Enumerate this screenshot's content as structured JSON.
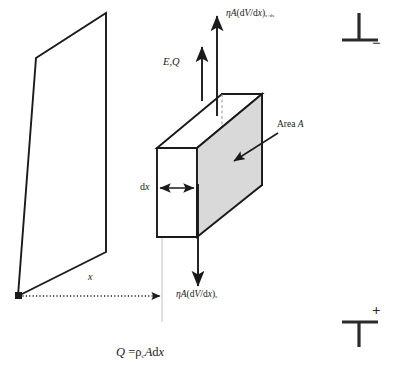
{
  "figure": {
    "type": "schematic-diagram",
    "background_color": "#ffffff",
    "line_color": "#1a1a1a",
    "shaded_face_color": "#d9d9d9"
  },
  "labels": {
    "flux_out": {
      "base": "ηA(dV/dx)",
      "subscript": "x+dx",
      "description": "flux leaving element at x plus dx"
    },
    "flux_in": {
      "base": "ηA(dV/dx)",
      "subscript": "x",
      "description": "flux entering element at x"
    },
    "field_charge": {
      "text": "E,Q",
      "description": "electric field and charge direction"
    },
    "area": {
      "text": "Area A",
      "description": "cross-sectional area of shaded face"
    },
    "thickness": {
      "text": "dx",
      "description": "element thickness along x"
    },
    "distance": {
      "text": "x",
      "description": "distance from electrode plane to element"
    },
    "equation": {
      "lhs": "Q",
      "eq": " =",
      "rho": "ρ",
      "rho_subscript": "c",
      "rhs_tail": "Adx",
      "full": "Q = ρcAdx"
    },
    "electrode_negative": {
      "symbol": "perpendicular-tee-down",
      "sign": "−",
      "description": "negative electrode terminal, top right"
    },
    "electrode_positive": {
      "symbol": "tee-up",
      "sign": "+",
      "description": "positive electrode terminal, bottom right"
    }
  },
  "geometry": {
    "electrode_plane": {
      "shape": "parallelogram",
      "points": "18,296 36,58 106,13 106,252"
    },
    "element_box": {
      "front_face": "157,148 157,237 197,237 197,148",
      "shaded_face": "222,94 222,212 262,185 262,94",
      "top_face": "157,148 197,148 262,94 222,94"
    },
    "arrows": {
      "x_distance": {
        "from": "18,296",
        "to": "162,296",
        "style": "dotted"
      },
      "dx_measure": {
        "from": "158,188",
        "to": "196,188",
        "style": "double-headed"
      },
      "field_charge": {
        "from": "202,100",
        "to": "202,47",
        "style": "up"
      },
      "flux_out": {
        "from": "217,115",
        "to": "217,15",
        "style": "up"
      },
      "flux_in": {
        "from": "198,185",
        "to": "198,287",
        "style": "down"
      },
      "area_pointer": {
        "from": "275,133",
        "to": "232,162",
        "style": "leader"
      }
    }
  }
}
